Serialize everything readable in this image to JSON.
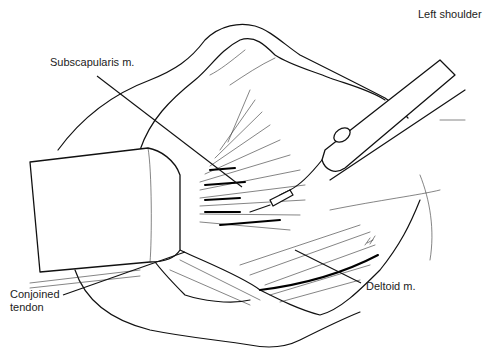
{
  "figure": {
    "title": "Left shoulder",
    "labels": {
      "subscapularis": "Subscapularis m.",
      "conjoined_tendon": "Conjoined\ntendon",
      "deltoid": "Deltoid m."
    },
    "colors": {
      "ink": "#111111",
      "background": "#ffffff",
      "label_text": "#222222"
    }
  }
}
